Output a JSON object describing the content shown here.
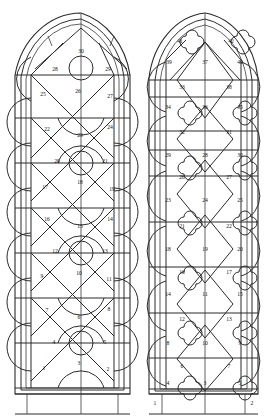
{
  "figure": {
    "kind": "gothic-window-tracery-panel-numbering-diagram",
    "background": "#ffffff",
    "ink": "#2b2b2b"
  },
  "windows": [
    {
      "id": "left-window",
      "name": "left-lancet-window",
      "tracery_motif": "circle-and-lozenge",
      "panel_numbers": [
        "1",
        "2",
        "3",
        "4",
        "5",
        "6",
        "7",
        "8",
        "9",
        "10",
        "11",
        "12",
        "13",
        "14",
        "15",
        "16",
        "17",
        "18",
        "19",
        "20",
        "21",
        "22",
        "23",
        "24",
        "25",
        "26",
        "27",
        "28",
        "29",
        "30"
      ],
      "rows": [
        {
          "row": "apex",
          "labels": [
            "30"
          ]
        },
        {
          "row": "r9",
          "labels": [
            "28",
            "29"
          ]
        },
        {
          "row": "r8",
          "labels": [
            "25",
            "26",
            "27"
          ]
        },
        {
          "row": "r7",
          "labels": [
            "22",
            "23",
            "24"
          ]
        },
        {
          "row": "r6",
          "labels": [
            "20",
            "21"
          ]
        },
        {
          "row": "r5",
          "labels": [
            "17",
            "18",
            "19"
          ]
        },
        {
          "row": "r4",
          "labels": [
            "16",
            "15",
            "14"
          ]
        },
        {
          "row": "r3",
          "labels": [
            "12",
            "13"
          ]
        },
        {
          "row": "r2",
          "labels": [
            "9",
            "10",
            "11"
          ]
        },
        {
          "row": "r1",
          "labels": [
            "7",
            "6",
            "8"
          ]
        },
        {
          "row": "r0",
          "labels": [
            "4",
            "5"
          ]
        },
        {
          "row": "sill",
          "labels": [
            "1",
            "3",
            "2"
          ]
        }
      ],
      "corner_labels": []
    },
    {
      "id": "right-window",
      "name": "right-lancet-window",
      "tracery_motif": "quatrefoil-and-lozenge",
      "panel_numbers": [
        "3",
        "4",
        "5",
        "6",
        "7",
        "8",
        "9",
        "10",
        "11",
        "12",
        "13",
        "14",
        "15",
        "16",
        "17",
        "18",
        "19",
        "20",
        "21",
        "22",
        "23",
        "24",
        "25",
        "26",
        "27",
        "28",
        "29",
        "30",
        "31",
        "32",
        "33",
        "34",
        "35",
        "36",
        "37",
        "38",
        "39",
        "40",
        "41",
        "42"
      ],
      "rows": [
        {
          "row": "apex-quatrefoils",
          "labels": [
            "41",
            "42"
          ]
        },
        {
          "row": "r12",
          "labels": [
            "39",
            "37",
            "40"
          ]
        },
        {
          "row": "r11",
          "labels": [
            "33",
            "38"
          ]
        },
        {
          "row": "r10",
          "labels": [
            "34",
            "36",
            "35"
          ]
        },
        {
          "row": "r9",
          "labels": [
            "32",
            "31"
          ]
        },
        {
          "row": "r8",
          "labels": [
            "29",
            "28",
            "30"
          ]
        },
        {
          "row": "r7",
          "labels": [
            "26",
            "27"
          ]
        },
        {
          "row": "r6",
          "labels": [
            "23",
            "24",
            "25"
          ]
        },
        {
          "row": "r5",
          "labels": [
            "21",
            "22"
          ]
        },
        {
          "row": "r4",
          "labels": [
            "18",
            "19",
            "20"
          ]
        },
        {
          "row": "r3",
          "labels": [
            "16",
            "17"
          ]
        },
        {
          "row": "r2",
          "labels": [
            "14",
            "11",
            "15"
          ]
        },
        {
          "row": "r1",
          "labels": [
            "12",
            "13"
          ]
        },
        {
          "row": "r0",
          "labels": [
            "8",
            "10",
            "9"
          ]
        },
        {
          "row": "rm1",
          "labels": [
            "6",
            "7"
          ]
        },
        {
          "row": "sill",
          "labels": [
            "4",
            "3",
            "5"
          ]
        }
      ],
      "corner_labels": [
        {
          "name": "sill-band-left-label",
          "text": "1"
        },
        {
          "name": "sill-band-right-label",
          "text": "2"
        }
      ]
    }
  ],
  "left_labels": {
    "n1": "1",
    "n2": "2",
    "n3": "3",
    "n4": "4",
    "n5": "5",
    "n6": "6",
    "n7": "7",
    "n8": "8",
    "n9": "9",
    "n10": "10",
    "n11": "11",
    "n12": "12",
    "n13": "13",
    "n14": "14",
    "n15": "15",
    "n16": "16",
    "n17": "17",
    "n18": "18",
    "n19": "19",
    "n20": "20",
    "n21": "21",
    "n22": "22",
    "n23": "23",
    "n24": "24",
    "n25": "25",
    "n26": "26",
    "n27": "27",
    "n28": "28",
    "n29": "29",
    "n30": "30"
  },
  "right_labels": {
    "n3": "3",
    "n4": "4",
    "n5": "5",
    "n6": "6",
    "n7": "7",
    "n8": "8",
    "n9": "9",
    "n10": "10",
    "n11": "11",
    "n12": "12",
    "n13": "13",
    "n14": "14",
    "n15": "15",
    "n16": "16",
    "n17": "17",
    "n18": "18",
    "n19": "19",
    "n20": "20",
    "n21": "21",
    "n22": "22",
    "n23": "23",
    "n24": "24",
    "n25": "25",
    "n26": "26",
    "n27": "27",
    "n28": "28",
    "n29": "29",
    "n30": "30",
    "n31": "31",
    "n32": "32",
    "n33": "33",
    "n34": "34",
    "n35": "35",
    "n36": "36",
    "n37": "37",
    "n38": "38",
    "n39": "39",
    "n40": "40",
    "n41": "41",
    "n42": "42",
    "corner_left": "1",
    "corner_right": "2"
  }
}
